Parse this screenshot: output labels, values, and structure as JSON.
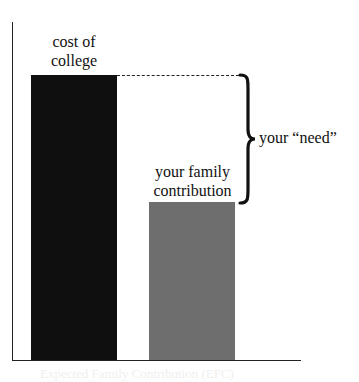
{
  "diagram": {
    "bars": [
      {
        "label": "cost of college",
        "label_lines": [
          "cost of",
          "college"
        ],
        "color": "#0f0f0f",
        "relative_height": 1.0
      },
      {
        "label": "your family contribution",
        "label_lines": [
          "your family",
          "contribution"
        ],
        "color": "#6e6e6e",
        "relative_height": 0.55
      }
    ],
    "difference": {
      "label": "your “need”",
      "indicator": "curly-brace",
      "reference_line": "dashed"
    },
    "footer_ghost_text": "Expected Family Contribution (EFC)"
  }
}
